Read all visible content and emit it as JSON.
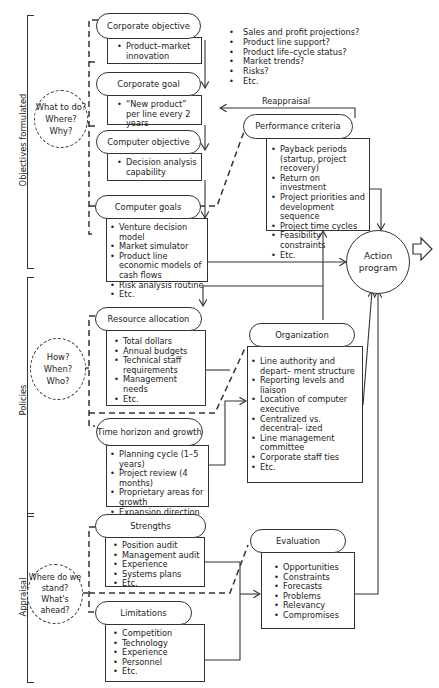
{
  "sections": {
    "objectives": {
      "label": "Objectives formulated",
      "questions": [
        "What to do?",
        "Where?",
        "Why?"
      ]
    },
    "policies": {
      "label": "Policies",
      "questions": [
        "How?",
        "When?",
        "Who?"
      ]
    },
    "appraisal": {
      "label": "Appraisal",
      "questions": [
        "Where do we",
        "stand?",
        "What's ahead?"
      ]
    }
  },
  "nodes": {
    "corporate_objective": {
      "title": "Corporate objective",
      "items": [
        "Product–market innovation"
      ]
    },
    "corporate_goal": {
      "title": "Corporate goal",
      "items": [
        "“New product” per line every 2 years"
      ]
    },
    "computer_objective": {
      "title": "Computer objective",
      "items": [
        "Decision analysis capability"
      ]
    },
    "computer_goals": {
      "title": "Computer goals",
      "items": [
        "Venture decision model",
        "Market simulator",
        "Product line economic models of cash flows",
        "Risk analysis routine",
        "Etc."
      ]
    },
    "performance_criteria": {
      "title": "Performance criteria",
      "items": [
        "Payback periods (startup, project recovery)",
        "Return on investment",
        "Project priorities and development sequence",
        "Project time cycles",
        "Feasibility constraints",
        "Etc."
      ]
    },
    "resource_allocation": {
      "title": "Resource allocation",
      "items": [
        "Total dollars",
        "Annual budgets",
        "Technical staff requirements",
        "Management needs",
        "Etc."
      ]
    },
    "time_horizon": {
      "title": "Time horizon and growth",
      "items": [
        "Planning cycle (1–5 years)",
        "Project review (4  months)",
        "Proprietary areas for growth",
        "Expansion direction",
        "Etc."
      ]
    },
    "organization": {
      "title": "Organization",
      "items": [
        "Line authority and depart– ment structure",
        "Reporting levels and liaison",
        "Location of computer executive",
        "Centralized vs. decentral– ized",
        "Line management committee",
        "Corporate staff ties",
        "Etc."
      ]
    },
    "strengths": {
      "title": "Strengths",
      "items": [
        "Position audit",
        "Management audit",
        "Experience",
        "Systems plans",
        "Etc."
      ]
    },
    "limitations": {
      "title": "Limitations",
      "items": [
        "Competition",
        "Technology",
        "Experience",
        "Personnel",
        "Etc."
      ]
    },
    "evaluation": {
      "title": "Evaluation",
      "items": [
        "Opportunities",
        "Constraints",
        "Forecasts",
        "Problems",
        "Relevancy",
        "Compromises"
      ]
    },
    "action_program": {
      "line1": "Action",
      "line2": "program"
    }
  },
  "market_questions": [
    "Sales and profit projections?",
    "Product line support?",
    "Product life–cycle status?",
    "Market trends?",
    "Risks?",
    "Etc."
  ],
  "reappraisal_label": "Reappraisal"
}
